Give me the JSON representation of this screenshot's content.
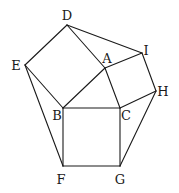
{
  "diagram": {
    "title": "",
    "vertices": [
      {
        "id": "D",
        "x": 67,
        "y": 25,
        "label": "D",
        "lx": 67,
        "ly": 20
      },
      {
        "id": "I",
        "x": 142,
        "y": 53,
        "label": "I",
        "lx": 146,
        "ly": 55
      },
      {
        "id": "A",
        "x": 105,
        "y": 68,
        "label": "A",
        "lx": 107,
        "ly": 63
      },
      {
        "id": "E",
        "x": 25,
        "y": 65,
        "label": "E",
        "lx": 16,
        "ly": 70
      },
      {
        "id": "H",
        "x": 156,
        "y": 91,
        "label": "H",
        "lx": 163,
        "ly": 96
      },
      {
        "id": "B",
        "x": 63,
        "y": 108,
        "label": "B",
        "lx": 57,
        "ly": 120
      },
      {
        "id": "C",
        "x": 120,
        "y": 108,
        "label": "C",
        "lx": 126,
        "ly": 120
      },
      {
        "id": "F",
        "x": 63,
        "y": 166,
        "label": "F",
        "lx": 61,
        "ly": 184
      },
      {
        "id": "G",
        "x": 120,
        "y": 166,
        "label": "G",
        "lx": 120,
        "ly": 184
      }
    ],
    "edges": [
      [
        "D",
        "E"
      ],
      [
        "D",
        "A"
      ],
      [
        "D",
        "I"
      ],
      [
        "E",
        "B"
      ],
      [
        "E",
        "F"
      ],
      [
        "A",
        "B"
      ],
      [
        "A",
        "I"
      ],
      [
        "A",
        "C"
      ],
      [
        "I",
        "H"
      ],
      [
        "H",
        "C"
      ],
      [
        "H",
        "G"
      ],
      [
        "B",
        "C"
      ],
      [
        "B",
        "F"
      ],
      [
        "C",
        "G"
      ],
      [
        "F",
        "G"
      ]
    ],
    "colors": {
      "stroke": "#1a1a1a",
      "background": "#ffffff"
    }
  }
}
